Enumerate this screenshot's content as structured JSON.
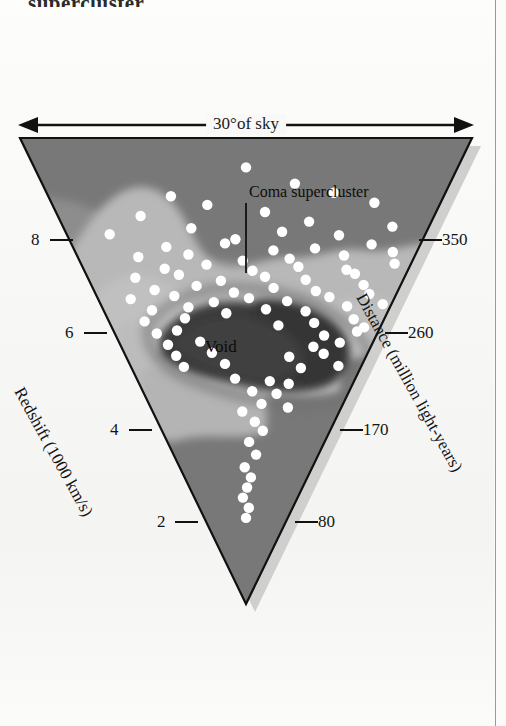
{
  "page": {
    "headline_fragment": "supercluster",
    "background_color": "#f7f7f5",
    "column_rule_color": "#9a9a9a"
  },
  "figure": {
    "top_arrow_label": "30°of sky",
    "coma_label": "Coma supercluster",
    "void_label": "Void",
    "left_axis_title": "Redshift (1000 km/s)",
    "right_axis_title": "Distance (million light-years)",
    "wedge_fill": "#7b7b7b",
    "wedge_outline": "#111111",
    "galaxy_dot_color": "#ffffff",
    "density_mid": "#8e8e8e",
    "density_high": "#b9b9b9",
    "density_void": "#3a3a3a",
    "shadow_color": "#c9c9c7"
  },
  "chart_data": {
    "type": "scatter",
    "projection": "wedge / pie-slice redshift survey",
    "xlabel": "30°of sky",
    "ylabel": "Redshift (1000 km/s)",
    "y2label": "Distance (million light-years)",
    "angular_extent_degrees": 30,
    "grid": false,
    "legend": false,
    "left_axis": {
      "label": "Redshift (1000 km/s)",
      "ticks": [
        8,
        6,
        4,
        2
      ],
      "tick_labels": [
        "8",
        "6",
        "4",
        "2"
      ],
      "units": "1000 km/s"
    },
    "right_axis": {
      "label": "Distance (million light-years)",
      "ticks": [
        350,
        260,
        170,
        80
      ],
      "tick_labels": [
        "350",
        "260",
        "170",
        "80"
      ],
      "units": "million light-years"
    },
    "annotations": [
      {
        "text": "Coma supercluster",
        "kind": "leader-line",
        "points_to": "dense band at redshift ~7"
      },
      {
        "text": "Void",
        "kind": "region-label",
        "points_to": "dark low-density region at redshift ~5.5"
      },
      {
        "text": "30°of sky",
        "kind": "double-arrow",
        "points_to": "angular width of survey"
      }
    ],
    "density_contours": [
      {
        "name": "background",
        "level": "low",
        "color": "#7b7b7b"
      },
      {
        "name": "moderate density",
        "level": "medium",
        "color": "#8e8e8e"
      },
      {
        "name": "supercluster ridge",
        "level": "high",
        "color": "#b9b9b9"
      },
      {
        "name": "void",
        "level": "lowest",
        "color": "#3a3a3a"
      }
    ],
    "points_note": "Each white dot is one galaxy plotted by sky angle (horizontal) and redshift/distance (radial).",
    "galaxy_count": 186,
    "galaxies": [
      [
        0.5,
        8.62
      ],
      [
        0.62,
        8.3
      ],
      [
        0.31,
        8.05
      ],
      [
        0.72,
        8.12
      ],
      [
        0.22,
        7.66
      ],
      [
        0.4,
        7.88
      ],
      [
        0.55,
        7.74
      ],
      [
        0.67,
        7.55
      ],
      [
        0.83,
        7.92
      ],
      [
        0.12,
        7.3
      ],
      [
        0.35,
        7.42
      ],
      [
        0.47,
        7.2
      ],
      [
        0.6,
        7.35
      ],
      [
        0.76,
        7.28
      ],
      [
        0.9,
        7.45
      ],
      [
        0.27,
        7.05
      ],
      [
        0.44,
        7.12
      ],
      [
        0.58,
        6.98
      ],
      [
        0.7,
        7.02
      ],
      [
        0.86,
        7.1
      ],
      [
        0.18,
        6.85
      ],
      [
        0.33,
        6.9
      ],
      [
        0.49,
        6.78
      ],
      [
        0.63,
        6.82
      ],
      [
        0.79,
        6.88
      ],
      [
        0.93,
        6.95
      ],
      [
        0.25,
        6.62
      ],
      [
        0.38,
        6.7
      ],
      [
        0.52,
        6.58
      ],
      [
        0.66,
        6.66
      ],
      [
        0.81,
        6.6
      ],
      [
        0.95,
        6.72
      ],
      [
        0.15,
        6.44
      ],
      [
        0.29,
        6.5
      ],
      [
        0.42,
        6.38
      ],
      [
        0.56,
        6.46
      ],
      [
        0.69,
        6.4
      ],
      [
        0.84,
        6.52
      ],
      [
        0.2,
        6.2
      ],
      [
        0.34,
        6.28
      ],
      [
        0.46,
        6.15
      ],
      [
        0.59,
        6.24
      ],
      [
        0.73,
        6.18
      ],
      [
        0.88,
        6.3
      ],
      [
        0.11,
        6.02
      ],
      [
        0.26,
        6.08
      ],
      [
        0.39,
        5.96
      ],
      [
        0.51,
        6.04
      ],
      [
        0.64,
        5.98
      ],
      [
        0.78,
        6.06
      ],
      [
        0.91,
        6.12
      ],
      [
        0.17,
        5.8
      ],
      [
        0.3,
        5.86
      ],
      [
        0.43,
        5.74
      ],
      [
        0.57,
        5.82
      ],
      [
        0.71,
        5.78
      ],
      [
        0.85,
        5.88
      ],
      [
        0.97,
        5.92
      ],
      [
        0.13,
        5.58
      ],
      [
        0.28,
        5.64
      ],
      [
        0.75,
        5.55
      ],
      [
        0.89,
        5.62
      ],
      [
        0.62,
        5.5
      ],
      [
        0.94,
        5.46
      ],
      [
        0.16,
        5.34
      ],
      [
        0.24,
        5.4
      ],
      [
        0.8,
        5.3
      ],
      [
        0.92,
        5.38
      ],
      [
        0.19,
        5.12
      ],
      [
        0.32,
        5.18
      ],
      [
        0.77,
        5.08
      ],
      [
        0.87,
        5.16
      ],
      [
        0.21,
        4.9
      ],
      [
        0.36,
        4.96
      ],
      [
        0.68,
        4.88
      ],
      [
        0.82,
        4.94
      ],
      [
        0.23,
        4.68
      ],
      [
        0.41,
        4.74
      ],
      [
        0.74,
        4.66
      ],
      [
        0.9,
        4.7
      ],
      [
        0.45,
        4.45
      ],
      [
        0.61,
        4.4
      ],
      [
        0.7,
        4.35
      ],
      [
        0.53,
        4.2
      ],
      [
        0.65,
        4.15
      ],
      [
        0.58,
        3.95
      ],
      [
        0.48,
        3.8
      ],
      [
        0.72,
        3.88
      ],
      [
        0.55,
        3.6
      ],
      [
        0.6,
        3.42
      ],
      [
        0.52,
        3.2
      ],
      [
        0.57,
        2.95
      ],
      [
        0.49,
        2.7
      ],
      [
        0.54,
        2.5
      ],
      [
        0.51,
        2.3
      ],
      [
        0.47,
        2.1
      ],
      [
        0.53,
        1.9
      ],
      [
        0.5,
        1.7
      ]
    ]
  }
}
